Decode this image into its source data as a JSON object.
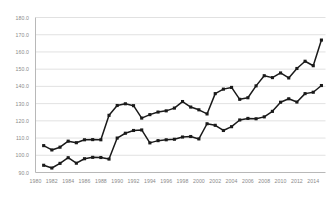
{
  "chart_data": {
    "type": "line",
    "title": "",
    "subtitle": "",
    "xlabel": "",
    "ylabel": "",
    "xlim": [
      1980,
      2015.5
    ],
    "ylim": [
      90.0,
      180.0
    ],
    "grid": true,
    "grid_axis": "y",
    "legend": "none",
    "y_ticks": [
      90.0,
      100.0,
      110.0,
      120.0,
      130.0,
      140.0,
      150.0,
      160.0,
      170.0,
      180.0
    ],
    "y_tick_labels": [
      "90.0",
      "100.0",
      "110.0",
      "120.0",
      "130.0",
      "140.0",
      "150.0",
      "160.0",
      "170.0",
      "180.0"
    ],
    "x_ticks": [
      1980,
      1982,
      1984,
      1986,
      1988,
      1990,
      1992,
      1994,
      1996,
      1998,
      2000,
      2002,
      2004,
      2006,
      2008,
      2010,
      2012,
      2014
    ],
    "x_tick_labels": [
      "1980",
      "1982",
      "1984",
      "1986",
      "1988",
      "1990",
      "1992",
      "1994",
      "1996",
      "1998",
      "2000",
      "2002",
      "2004",
      "2006",
      "2008",
      "2010",
      "2012",
      "2014"
    ],
    "x": [
      1981,
      1982,
      1983,
      1984,
      1985,
      1986,
      1987,
      1988,
      1989,
      1990,
      1991,
      1992,
      1993,
      1994,
      1995,
      1996,
      1997,
      1998,
      1999,
      2000,
      2001,
      2002,
      2003,
      2004,
      2005,
      2006,
      2007,
      2008,
      2009,
      2010,
      2011,
      2012,
      2013,
      2014,
      2015
    ],
    "series": [
      {
        "name": "upper-series",
        "color": "#1a1a1a",
        "marker": "square",
        "values": [
          105.6,
          103.1,
          104.7,
          108.2,
          107.3,
          109.0,
          109.1,
          109.0,
          123.2,
          128.9,
          129.9,
          128.8,
          121.6,
          123.6,
          125.1,
          125.8,
          127.4,
          131.2,
          128.0,
          126.4,
          124.0,
          135.8,
          138.4,
          139.4,
          132.5,
          133.4,
          140.3,
          146.2,
          145.1,
          147.8,
          144.9,
          150.4,
          154.6,
          152.0,
          166.9
        ]
      },
      {
        "name": "lower-series",
        "color": "#1a1a1a",
        "marker": "square",
        "values": [
          94.2,
          92.6,
          95.3,
          98.6,
          95.4,
          98.0,
          98.8,
          98.7,
          97.8,
          110.0,
          112.8,
          114.4,
          114.7,
          107.2,
          108.5,
          109.0,
          109.3,
          110.6,
          110.9,
          109.5,
          118.3,
          117.4,
          114.4,
          116.6,
          120.5,
          121.4,
          121.2,
          122.3,
          125.5,
          130.8,
          132.8,
          130.9,
          135.8,
          136.6,
          140.5
        ]
      }
    ]
  },
  "style": {
    "axis_color": "#b0b0b0",
    "grid_color": "#d9d9d9",
    "tick_label_color": "#8a8a8a",
    "plot_background": "#ffffff"
  }
}
